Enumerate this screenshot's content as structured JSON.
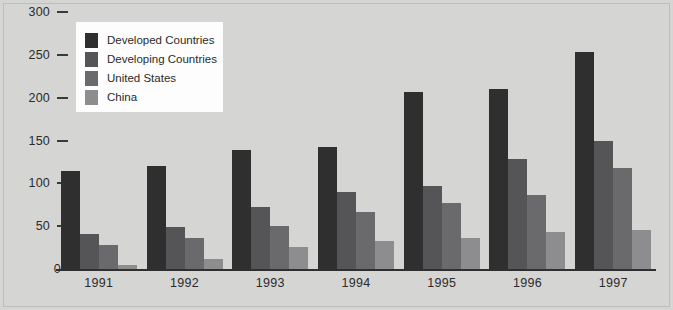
{
  "chart_data": {
    "type": "bar",
    "title": "",
    "subtitle": "",
    "xlabel": "",
    "ylabel": "",
    "categories": [
      "1991",
      "1992",
      "1993",
      "1994",
      "1995",
      "1996",
      "1997"
    ],
    "series": [
      {
        "name": "Developed Countries",
        "color": "#2f2f30",
        "values": [
          114,
          120,
          139,
          143,
          207,
          210,
          253
        ]
      },
      {
        "name": "Developing Countries",
        "color": "#555558",
        "values": [
          41,
          49,
          72,
          90,
          97,
          129,
          150
        ]
      },
      {
        "name": "United States",
        "color": "#6a6a6c",
        "values": [
          28,
          36,
          50,
          67,
          77,
          86,
          118
        ]
      },
      {
        "name": "China",
        "color": "#8d8d8f",
        "values": [
          5,
          12,
          26,
          33,
          36,
          43,
          46
        ]
      }
    ],
    "ylim": [
      0,
      300
    ],
    "yticks": [
      0,
      50,
      100,
      150,
      200,
      250,
      300
    ],
    "ytick_labels": [
      "0",
      "50",
      "100",
      "150",
      "200",
      "250",
      "300"
    ],
    "grid": false,
    "legend_position": "top-left",
    "legend_entries": [
      "Developed Countries",
      "Developing Countries",
      "United States",
      "China"
    ],
    "background_color": "#d5d5d3",
    "legend_background_color": "#fdfdfd",
    "axis_color": "#2f2f2f",
    "text_color": "#2b2b2b"
  }
}
